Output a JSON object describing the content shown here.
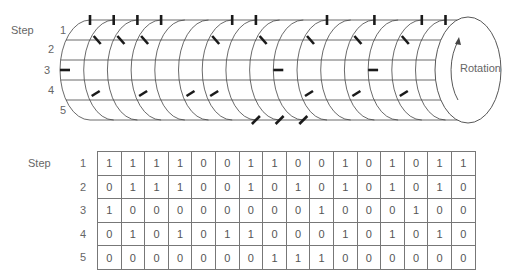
{
  "cylinder": {
    "step_label": "Step",
    "row_labels": [
      "1",
      "2",
      "3",
      "4",
      "5"
    ],
    "rotation_label": "Rotation"
  },
  "table": {
    "step_label": "Step",
    "row_labels": [
      "1",
      "2",
      "3",
      "4",
      "5"
    ],
    "rows": [
      [
        1,
        1,
        1,
        1,
        0,
        0,
        1,
        1,
        0,
        0,
        1,
        0,
        1,
        0,
        1,
        1
      ],
      [
        0,
        1,
        1,
        1,
        0,
        0,
        1,
        0,
        1,
        0,
        1,
        0,
        1,
        0,
        1,
        0
      ],
      [
        1,
        0,
        0,
        0,
        0,
        0,
        0,
        0,
        0,
        1,
        0,
        0,
        0,
        1,
        0,
        0
      ],
      [
        0,
        1,
        0,
        1,
        0,
        1,
        1,
        0,
        0,
        0,
        1,
        0,
        1,
        0,
        1,
        0
      ],
      [
        0,
        0,
        0,
        0,
        0,
        0,
        0,
        1,
        1,
        1,
        0,
        0,
        0,
        0,
        0,
        0
      ]
    ]
  },
  "colors": {
    "line": "#444444",
    "pin": "#1a1a1a",
    "text": "#555555"
  }
}
